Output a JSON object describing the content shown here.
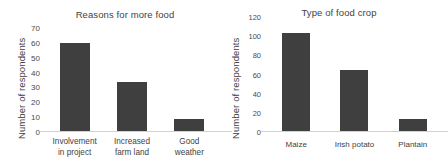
{
  "chart_data": [
    {
      "type": "bar",
      "title": "Reasons for more food",
      "xlabel": "",
      "ylabel": "Number of respondents",
      "categories": [
        "Involvement in project",
        "Increased farm land",
        "Good weather"
      ],
      "category_lines": [
        [
          "Involvement",
          "in project"
        ],
        [
          "Increased",
          "farm land"
        ],
        [
          "Good",
          "weather"
        ]
      ],
      "values": [
        60,
        34,
        9
      ],
      "ylim": [
        0,
        70
      ],
      "yticks": [
        0,
        10,
        20,
        30,
        40,
        50,
        60,
        70
      ],
      "grid": false,
      "legend": "none",
      "bar_color": "#3f3f3f"
    },
    {
      "type": "bar",
      "title": "Type of food crop",
      "xlabel": "",
      "ylabel": "Number of respondents",
      "categories": [
        "Maize",
        "Irish potato",
        "Plantain"
      ],
      "category_lines": [
        [
          "Maize"
        ],
        [
          "Irish potato"
        ],
        [
          "Plantain"
        ]
      ],
      "values": [
        103,
        65,
        14
      ],
      "ylim": [
        0,
        120
      ],
      "yticks": [
        0,
        20,
        40,
        60,
        80,
        100,
        120
      ],
      "grid": false,
      "legend": "none",
      "bar_color": "#3f3f3f"
    }
  ]
}
